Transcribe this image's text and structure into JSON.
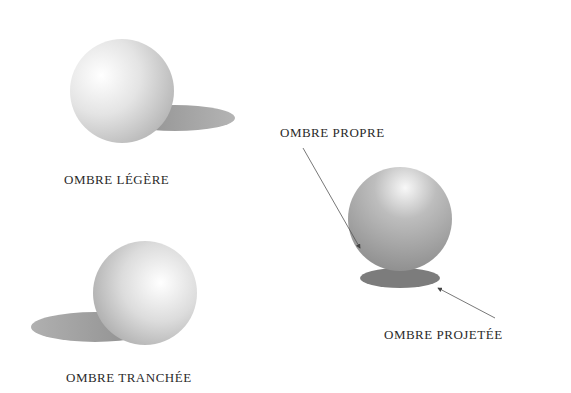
{
  "figure": {
    "labels": {
      "light_shadow": "OMBRE LÉGÈRE",
      "sharp_shadow": "OMBRE TRANCHÉE",
      "own_shadow": "OMBRE PROPRE",
      "cast_shadow": "OMBRE PROJETÉE"
    },
    "colors": {
      "background": "#ffffff",
      "text": "#2a2a2a",
      "sphere_light": "#ffffff",
      "sphere_mid": "#c8c8c8",
      "shadow": "#9a9a9a",
      "arrow": "#555555"
    }
  }
}
